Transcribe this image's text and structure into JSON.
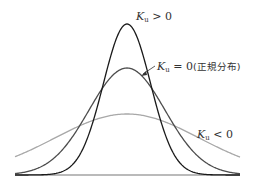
{
  "diagram": {
    "curves": [
      {
        "id": "leptokurtic",
        "label_var": "K",
        "label_sub": "u",
        "label_rel": ">",
        "label_val": "0",
        "label_note": "",
        "color": "#1a1a1a",
        "sigma": 0.62,
        "peak_y": 24
      },
      {
        "id": "normal",
        "label_var": "K",
        "label_sub": "u",
        "label_rel": "=",
        "label_val": "0",
        "label_note": "(正規分布)",
        "color": "#4d4d4d",
        "sigma": 1.0,
        "peak_y": 68
      },
      {
        "id": "platykurtic",
        "label_var": "K",
        "label_sub": "u",
        "label_rel": "<",
        "label_val": "0",
        "label_note": "",
        "color": "#a8a8a8",
        "sigma": 1.9,
        "peak_y": 114
      }
    ],
    "baseline_color": "#555555"
  }
}
